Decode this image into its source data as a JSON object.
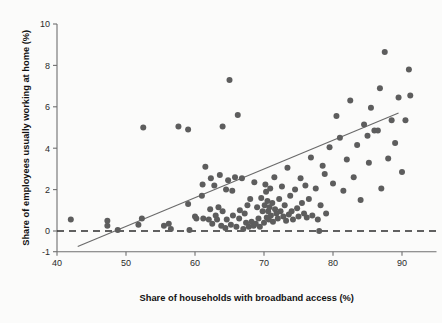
{
  "chart_data": {
    "type": "scatter",
    "title": "",
    "xlabel": "Share of households with broadband access (%)",
    "ylabel": "Share of employees usually working at home (%)",
    "xlim": [
      40,
      95
    ],
    "ylim": [
      -1,
      10
    ],
    "xticks": [
      40,
      50,
      60,
      70,
      80,
      90
    ],
    "yticks": [
      -1,
      0,
      2,
      4,
      6,
      8,
      10
    ],
    "grid": false,
    "legend": null,
    "marker_color": "#5d5d5d",
    "line_color": "#6a6a6a",
    "background_color": "#fbfbfa",
    "annotations": [
      {
        "name": "zero-reference-line",
        "type": "horizontal-dashed",
        "y": 0
      },
      {
        "name": "regression-line",
        "type": "linear-fit",
        "x0": 43.0,
        "y0": -0.75,
        "x1": 89.5,
        "y1": 5.7
      }
    ],
    "points": [
      [
        42.0,
        0.55
      ],
      [
        47.3,
        0.25
      ],
      [
        47.3,
        0.5
      ],
      [
        48.8,
        0.05
      ],
      [
        51.8,
        0.3
      ],
      [
        52.3,
        0.6
      ],
      [
        52.5,
        5.0
      ],
      [
        55.5,
        0.25
      ],
      [
        56.2,
        0.35
      ],
      [
        56.5,
        0.1
      ],
      [
        57.6,
        5.05
      ],
      [
        59.2,
        0.05
      ],
      [
        59.0,
        1.3
      ],
      [
        59.0,
        4.9
      ],
      [
        60.0,
        0.7
      ],
      [
        60.2,
        0.6
      ],
      [
        61.0,
        1.7
      ],
      [
        61.1,
        2.25
      ],
      [
        61.2,
        0.6
      ],
      [
        61.5,
        3.1
      ],
      [
        62.0,
        0.55
      ],
      [
        62.2,
        1.05
      ],
      [
        62.3,
        2.55
      ],
      [
        62.5,
        0.35
      ],
      [
        62.8,
        2.2
      ],
      [
        63.0,
        0.75
      ],
      [
        63.2,
        0.55
      ],
      [
        63.4,
        1.15
      ],
      [
        63.6,
        2.7
      ],
      [
        63.8,
        0.25
      ],
      [
        64.0,
        0.95
      ],
      [
        64.0,
        5.05
      ],
      [
        64.4,
        0.15
      ],
      [
        64.5,
        2.0
      ],
      [
        64.6,
        0.55
      ],
      [
        64.8,
        2.45
      ],
      [
        65.0,
        7.3
      ],
      [
        65.2,
        0.3
      ],
      [
        65.4,
        1.95
      ],
      [
        65.5,
        0.75
      ],
      [
        65.8,
        2.6
      ],
      [
        66.0,
        0.2
      ],
      [
        66.2,
        5.6
      ],
      [
        66.4,
        0.6
      ],
      [
        66.5,
        1.0
      ],
      [
        66.8,
        2.55
      ],
      [
        67.0,
        0.1
      ],
      [
        67.2,
        0.85
      ],
      [
        67.4,
        0.4
      ],
      [
        67.6,
        1.25
      ],
      [
        67.8,
        0.2
      ],
      [
        68.0,
        1.55
      ],
      [
        68.2,
        0.45
      ],
      [
        68.5,
        0.25
      ],
      [
        68.6,
        2.35
      ],
      [
        68.8,
        0.35
      ],
      [
        69.0,
        1.15
      ],
      [
        69.2,
        0.6
      ],
      [
        69.4,
        0.2
      ],
      [
        69.6,
        1.6
      ],
      [
        69.8,
        0.95
      ],
      [
        70.0,
        0.4
      ],
      [
        70.1,
        1.25
      ],
      [
        70.2,
        2.25
      ],
      [
        70.3,
        1.9
      ],
      [
        70.4,
        0.65
      ],
      [
        70.5,
        1.45
      ],
      [
        70.6,
        0.95
      ],
      [
        70.7,
        0.55
      ],
      [
        70.8,
        1.15
      ],
      [
        70.9,
        2.05
      ],
      [
        71.0,
        0.75
      ],
      [
        71.2,
        1.35
      ],
      [
        71.3,
        0.45
      ],
      [
        71.5,
        2.6
      ],
      [
        71.6,
        1.05
      ],
      [
        71.8,
        0.85
      ],
      [
        72.0,
        0.6
      ],
      [
        72.2,
        1.55
      ],
      [
        72.4,
        0.95
      ],
      [
        72.6,
        2.15
      ],
      [
        72.8,
        0.7
      ],
      [
        73.0,
        1.25
      ],
      [
        73.2,
        0.5
      ],
      [
        73.4,
        3.05
      ],
      [
        73.6,
        0.8
      ],
      [
        73.8,
        1.7
      ],
      [
        74.0,
        0.95
      ],
      [
        74.2,
        0.55
      ],
      [
        74.5,
        2.0
      ],
      [
        74.8,
        1.1
      ],
      [
        75.0,
        0.7
      ],
      [
        75.3,
        2.55
      ],
      [
        75.5,
        1.35
      ],
      [
        75.8,
        0.85
      ],
      [
        76.0,
        2.2
      ],
      [
        76.2,
        0.65
      ],
      [
        76.5,
        1.55
      ],
      [
        76.8,
        3.55
      ],
      [
        77.0,
        0.75
      ],
      [
        77.5,
        2.05
      ],
      [
        77.8,
        0.55
      ],
      [
        78.0,
        0.0
      ],
      [
        78.2,
        1.25
      ],
      [
        78.5,
        3.15
      ],
      [
        78.8,
        2.75
      ],
      [
        79.0,
        0.85
      ],
      [
        79.5,
        4.05
      ],
      [
        80.0,
        2.3
      ],
      [
        80.5,
        5.55
      ],
      [
        81.0,
        4.5
      ],
      [
        81.5,
        1.95
      ],
      [
        82.0,
        3.45
      ],
      [
        82.5,
        6.3
      ],
      [
        83.0,
        2.6
      ],
      [
        83.5,
        4.15
      ],
      [
        84.0,
        1.5
      ],
      [
        84.5,
        5.15
      ],
      [
        85.0,
        4.6
      ],
      [
        85.2,
        3.3
      ],
      [
        85.5,
        5.95
      ],
      [
        86.0,
        4.85
      ],
      [
        86.5,
        4.85
      ],
      [
        86.8,
        6.9
      ],
      [
        87.0,
        2.05
      ],
      [
        87.5,
        8.65
      ],
      [
        88.0,
        3.5
      ],
      [
        88.5,
        5.35
      ],
      [
        89.0,
        4.25
      ],
      [
        89.5,
        6.45
      ],
      [
        90.0,
        2.85
      ],
      [
        90.5,
        5.35
      ],
      [
        91.0,
        7.8
      ],
      [
        91.2,
        6.55
      ]
    ]
  }
}
